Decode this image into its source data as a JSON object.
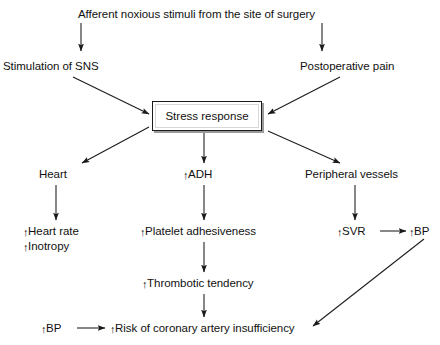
{
  "diagram": {
    "title_text": "Afferent noxious stimuli from the site of surgery",
    "center_box": {
      "label": "Stress response"
    },
    "nodes": [
      {
        "id": "afferent",
        "text": "Afferent noxious stimuli from the site of surgery",
        "arrow": "",
        "x": 78,
        "y": 8
      },
      {
        "id": "sns",
        "text": "Stimulation of SNS",
        "arrow": "",
        "x": 3,
        "y": 60
      },
      {
        "id": "postop-pain",
        "text": "Postoperative pain",
        "arrow": "",
        "x": 300,
        "y": 60
      },
      {
        "id": "heart",
        "text": "Heart",
        "arrow": "",
        "x": 39,
        "y": 168
      },
      {
        "id": "adh",
        "text": "ADH",
        "arrow": "↑",
        "x": 183,
        "y": 168
      },
      {
        "id": "periph",
        "text": "Peripheral vessels",
        "arrow": "",
        "x": 305,
        "y": 168
      },
      {
        "id": "heart-rate",
        "text": "Heart rate",
        "arrow": "↑",
        "x": 23,
        "y": 225
      },
      {
        "id": "inotropy",
        "text": "Inotropy",
        "arrow": "↑",
        "x": 23,
        "y": 240
      },
      {
        "id": "platelet",
        "text": "Platelet adhesiveness",
        "arrow": "↑",
        "x": 140,
        "y": 225
      },
      {
        "id": "svr",
        "text": "SVR",
        "arrow": "↑",
        "x": 337,
        "y": 225
      },
      {
        "id": "bp-top",
        "text": "BP",
        "arrow": "↑",
        "x": 409,
        "y": 225
      },
      {
        "id": "thrombotic",
        "text": "Thrombotic tendency",
        "arrow": "↑",
        "x": 142,
        "y": 277
      },
      {
        "id": "bp-bottom",
        "text": "BP",
        "arrow": "↑",
        "x": 41,
        "y": 322
      },
      {
        "id": "risk",
        "text": "Risk of coronary artery insufficiency",
        "arrow": "↑",
        "x": 110,
        "y": 322
      }
    ],
    "connectors": [
      {
        "id": "afferent-to-sns",
        "from": "afferent",
        "to": "sns"
      },
      {
        "id": "afferent-to-postop",
        "from": "afferent",
        "to": "postop-pain"
      },
      {
        "id": "sns-to-stress",
        "from": "sns",
        "to": "center_box"
      },
      {
        "id": "postop-to-stress",
        "from": "postop-pain",
        "to": "center_box"
      },
      {
        "id": "stress-to-heart",
        "from": "center_box",
        "to": "heart"
      },
      {
        "id": "stress-to-adh",
        "from": "center_box",
        "to": "adh"
      },
      {
        "id": "stress-to-periph",
        "from": "center_box",
        "to": "periph"
      },
      {
        "id": "heart-to-heart-rate",
        "from": "heart",
        "to": "heart-rate"
      },
      {
        "id": "adh-to-platelet",
        "from": "adh",
        "to": "platelet"
      },
      {
        "id": "periph-to-svr",
        "from": "periph",
        "to": "svr"
      },
      {
        "id": "svr-to-bp",
        "from": "svr",
        "to": "bp-top"
      },
      {
        "id": "platelet-to-thrombotic",
        "from": "platelet",
        "to": "thrombotic"
      },
      {
        "id": "thrombotic-to-risk",
        "from": "thrombotic",
        "to": "risk"
      },
      {
        "id": "bp-bottom-to-risk",
        "from": "bp-bottom",
        "to": "risk"
      },
      {
        "id": "bp-top-to-risk",
        "from": "bp-top",
        "to": "risk"
      }
    ],
    "colors": {
      "line": "#1a1a1a",
      "text": "#111111",
      "background": "#ffffff",
      "box_shadow": "#9a9a9a"
    }
  }
}
